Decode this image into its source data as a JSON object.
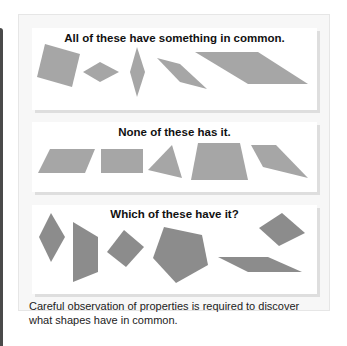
{
  "figure": {
    "sections": [
      {
        "id": "have-it",
        "title": "All of these have something in common.",
        "shape_color": "#a6a6a6",
        "shapes": [
          {
            "name": "tilted-square",
            "points": "45,44 80,54 72,87 37,77"
          },
          {
            "name": "small-rhombus",
            "points": "83,72 100,62 119,72 100,82"
          },
          {
            "name": "tall-rhombus",
            "points": "137,47 145,72 137,97 130,72"
          },
          {
            "name": "slanted-rhombus",
            "points": "157,58 180,64 207,89 180,82"
          },
          {
            "name": "long-parallelogram",
            "points": "195,52 258,52 308,84 248,84"
          }
        ]
      },
      {
        "id": "none-have-it",
        "title": "None of these has it.",
        "shape_color": "#a6a6a6",
        "shapes": [
          {
            "name": "parallelogram",
            "points": "38,173 50,149 95,149 85,173"
          },
          {
            "name": "rectangle",
            "points": "101,149 143,149 143,173 101,173"
          },
          {
            "name": "triangle",
            "points": "148,170 172,145 182,178"
          },
          {
            "name": "trapezoid",
            "points": "198,143 240,143 248,180 191,180"
          },
          {
            "name": "irregular-quadrilateral",
            "points": "251,145 276,145 308,178 263,167"
          }
        ]
      },
      {
        "id": "which-have-it",
        "title": "Which of these have it?",
        "shape_color": "#8c8c8c",
        "shapes": [
          {
            "name": "rhombus",
            "points": "39,237 51,213 65,237 51,262"
          },
          {
            "name": "trapezoid-vertical",
            "points": "73,222 98,237 98,272 73,282"
          },
          {
            "name": "tilted-square",
            "points": "107,252 124,230 144,247 126,267"
          },
          {
            "name": "pentagon",
            "points": "164,227 202,235 208,265 176,283 153,258"
          },
          {
            "name": "small-rhombus",
            "points": "259,228 282,213 305,233 279,246"
          },
          {
            "name": "thin-parallelogram",
            "points": "218,257 268,257 302,272 248,272"
          }
        ]
      }
    ],
    "caption_line1": "Careful observation of properties is required to discover",
    "caption_line2": "what shapes have in common."
  }
}
